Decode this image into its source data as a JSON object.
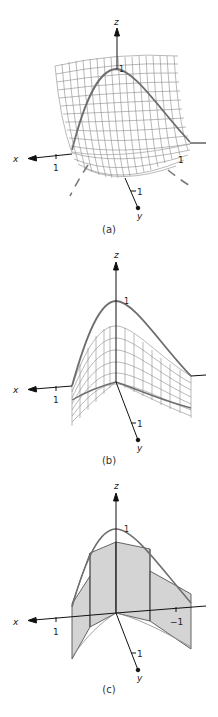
{
  "figure": {
    "panels": [
      {
        "id": "a",
        "caption": "(a)",
        "axis_labels": {
          "x": "x",
          "y": "y",
          "z": "z"
        },
        "tick_labels": {
          "x": "1",
          "y": "1",
          "z": "1",
          "neg_x": "1"
        },
        "description": "Saddle-shaped mesh surface with highlighted bell curve and dashed projection curve"
      },
      {
        "id": "b",
        "caption": "(b)",
        "axis_labels": {
          "x": "x",
          "y": "y",
          "z": "z"
        },
        "tick_labels": {
          "x": "1",
          "y": "1",
          "z": "1"
        },
        "description": "Mesh surface bounded above by bell curve, extruded along y"
      },
      {
        "id": "c",
        "caption": "(c)",
        "axis_labels": {
          "x": "x",
          "y": "y",
          "z": "z"
        },
        "tick_labels": {
          "x": "1",
          "y": "1",
          "z": "1",
          "neg_x": "−1"
        },
        "description": "Piecewise-linear shaded approximation panels under bell curve"
      }
    ],
    "colors": {
      "curve": "#6e6e6e",
      "mesh": "#8a8a8a",
      "axis": "#111111",
      "fill": "#d4d4d4",
      "dash": "#7a7a7a"
    }
  }
}
